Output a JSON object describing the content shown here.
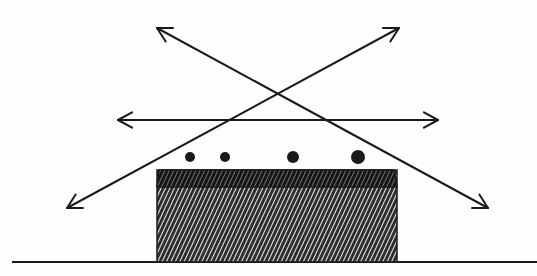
{
  "diagram": {
    "title": "",
    "description": "Hand-drawn sketch: hatched block (with darker top layer) resting on a ground line, four dots above it, and three double-headed arrows (one horizontal, two crossing diagonals) above.",
    "colors": {
      "ink": "#1a1a1a",
      "background": "#fdfdfd",
      "hatch_light": "#ffffff"
    },
    "ground_line": {
      "x1": 12,
      "y1": 262,
      "x2": 537,
      "y2": 262
    },
    "block": {
      "x": 157,
      "y": 170,
      "width": 240,
      "height": 92,
      "top_layer": {
        "height": 17,
        "style": "dense-dark-hatch"
      },
      "body_style": "diagonal-hatch"
    },
    "dots": [
      {
        "cx": 190,
        "cy": 157,
        "r": 5
      },
      {
        "cx": 225,
        "cy": 157,
        "r": 5
      },
      {
        "cx": 293,
        "cy": 157,
        "r": 6
      },
      {
        "cx": 358,
        "cy": 157,
        "r": 7
      }
    ],
    "arrows": [
      {
        "name": "horizontal-arrow",
        "x1": 118,
        "y1": 120,
        "x2": 438,
        "y2": 120,
        "heads": "both"
      },
      {
        "name": "diagonal-arrow-down-right",
        "x1": 157,
        "y1": 28,
        "x2": 488,
        "y2": 208,
        "heads": "both"
      },
      {
        "name": "diagonal-arrow-down-left",
        "x1": 399,
        "y1": 28,
        "x2": 67,
        "y2": 208,
        "heads": "both"
      }
    ]
  }
}
